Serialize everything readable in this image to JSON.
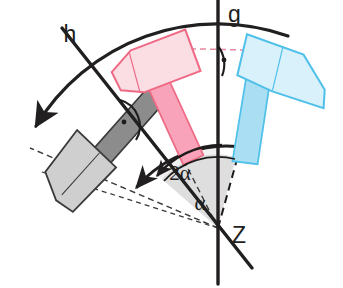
{
  "figure": {
    "background_color": "#ffffff"
  },
  "labels": {
    "axis_g": "g",
    "axis_h": "h",
    "centre": "Z",
    "angle_inner": "α",
    "angle_outer": "2α"
  },
  "geometry": {
    "centre_x": 218,
    "centre_y": 228,
    "axis_g_angle_deg": 90,
    "axis_h_angle_deg": 58,
    "outer_arc_radius": 212,
    "mid_arc_radius": 118,
    "inner_arc_radius": 72,
    "alpha_deg": 23,
    "two_alpha_deg": 46
  },
  "colors": {
    "ink": "#211f1f",
    "pink_stroke": "#ef6a85",
    "pink_head_fill": "#fbdde4",
    "pink_handle_fill": "#f9a3ba",
    "blue_stroke": "#4ec0ea",
    "blue_head_fill": "#d9f1fb",
    "blue_handle_fill": "#aadff3",
    "gray_stroke": "#3a3a3a",
    "gray_head_fill": "#cfcfcf",
    "gray_handle_fill": "#8c8c8c",
    "sector_fill": "#e2e2e2",
    "sector_fill_light": "#f2f2f2",
    "dashed_pink": "#e8889e"
  },
  "objects": [
    {
      "id": "hammer-gray",
      "name": "gray-hammer",
      "role": "image-after-rotation",
      "color_key": "gray",
      "rotation_deg": -46,
      "description": "Rotated hammer on the left, shaded grey, with dashed handle axis"
    },
    {
      "id": "hammer-pink",
      "name": "pink-hammer",
      "role": "intermediate-reflection",
      "color_key": "pink",
      "rotation_deg": -23,
      "description": "Intermediate pink hammer mirrored across axis h"
    },
    {
      "id": "hammer-blue",
      "name": "blue-hammer",
      "role": "original",
      "color_key": "blue",
      "rotation_deg": 0,
      "description": "Original blue hammer at the right, with dashed handle axis"
    }
  ],
  "markers": [
    {
      "id": "right-angle-h",
      "name": "right-angle-marker-h",
      "text": "·"
    },
    {
      "id": "right-angle-g",
      "name": "right-angle-marker-g",
      "text": "·"
    }
  ]
}
